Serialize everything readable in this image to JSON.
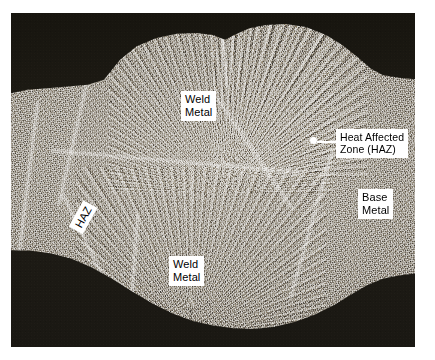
{
  "figure": {
    "type": "metallographic-cross-section-photograph",
    "colors": {
      "background": "#ffffff",
      "mount_dark": "#1a1815",
      "specimen_light": "#b9b4ab",
      "specimen_mid": "#918c84",
      "label_background": "#ffffff",
      "label_text": "#000000",
      "callout_marker": "#ffffff"
    }
  },
  "annotations": [
    {
      "id": "weld-metal-top",
      "text": "Weld\nMetal",
      "lines": [
        "Weld",
        "Metal"
      ],
      "style": "boxed-white",
      "rotation_deg": 0,
      "position": {
        "x": 170,
        "y": 78
      }
    },
    {
      "id": "heat-affected-zone",
      "text": "Heat Affected\nZone (HAZ)",
      "lines": [
        "Heat Affected",
        "Zone (HAZ)"
      ],
      "style": "boxed-white-with-leader",
      "rotation_deg": 0,
      "position": {
        "x": 325,
        "y": 116
      },
      "marker": {
        "x": 302,
        "y": 127,
        "shape": "dot"
      },
      "leader_line": {
        "from_x": 306,
        "to_x": 327,
        "y": 128
      }
    },
    {
      "id": "base-metal",
      "text": "Base\nMetal",
      "lines": [
        "Base",
        "Metal"
      ],
      "style": "boxed-white",
      "rotation_deg": 0,
      "position": {
        "x": 347,
        "y": 176
      }
    },
    {
      "id": "haz-left",
      "text": "HAZ",
      "lines": [
        "HAZ"
      ],
      "style": "boxed-white-rotated",
      "rotation_deg": -61,
      "position": {
        "x": 57,
        "y": 196
      }
    },
    {
      "id": "weld-metal-bottom",
      "text": "Weld\nMetal",
      "lines": [
        "Weld",
        "Metal"
      ],
      "style": "boxed-white",
      "rotation_deg": 0,
      "position": {
        "x": 158,
        "y": 243
      }
    }
  ]
}
